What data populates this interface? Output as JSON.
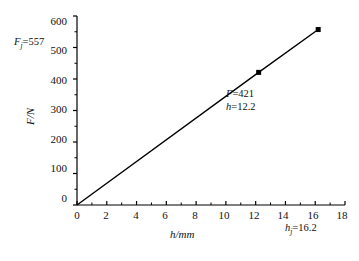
{
  "chart_data": {
    "type": "line",
    "title": "",
    "xlabel": "h/mm",
    "ylabel": "F/N",
    "xlim": [
      0,
      18
    ],
    "ylim": [
      0,
      600
    ],
    "grid": false,
    "legend": null,
    "x_ticks": [
      "0",
      "2",
      "4",
      "6",
      "8",
      "10",
      "12",
      "14",
      "16",
      "18"
    ],
    "x_tick_values": [
      0,
      2,
      4,
      6,
      8,
      10,
      12,
      14,
      16,
      18
    ],
    "y_ticks": [
      "0",
      "100",
      "200",
      "300",
      "400",
      "500",
      "600"
    ],
    "y_tick_values": [
      0,
      100,
      200,
      300,
      400,
      500,
      600
    ],
    "x_minor_step": 1,
    "y_minor_step": 50,
    "series": [
      {
        "name": "F vs h",
        "x": [
          0,
          12.2,
          16.2
        ],
        "values": [
          0,
          421,
          557
        ],
        "marker": "square",
        "marker_points": [
          {
            "x": 12.2,
            "y": 421
          },
          {
            "x": 16.2,
            "y": 557
          }
        ],
        "line_color": "#000000"
      }
    ],
    "annotations": [
      {
        "name": "fj-label",
        "text_prefix": "F",
        "text_sub": "j",
        "text_suffix": "=557",
        "value": 557,
        "axis": "y"
      },
      {
        "name": "hj-label",
        "text_prefix": "h",
        "text_sub": "j",
        "text_suffix": "=16.2",
        "value": 16.2,
        "axis": "x"
      },
      {
        "name": "point-force-label",
        "text_prefix": "F",
        "text_sub": "",
        "text_suffix": "=421",
        "value": 421,
        "axis": "point"
      },
      {
        "name": "point-height-label",
        "text_prefix": "h",
        "text_sub": "",
        "text_suffix": "=12.2",
        "value": 12.2,
        "axis": "point"
      }
    ]
  },
  "axes": {
    "y_title": "F/N",
    "x_title": "h/mm",
    "y_tick_0": "0",
    "y_tick_1": "100",
    "y_tick_2": "200",
    "y_tick_3": "300",
    "y_tick_4": "400",
    "y_tick_5": "500",
    "y_tick_6": "600",
    "x_tick_0": "0",
    "x_tick_1": "2",
    "x_tick_2": "4",
    "x_tick_3": "6",
    "x_tick_4": "8",
    "x_tick_5": "10",
    "x_tick_6": "12",
    "x_tick_7": "14",
    "x_tick_8": "16",
    "x_tick_9": "18"
  },
  "labels": {
    "fj_var": "F",
    "fj_sub": "j",
    "fj_eq": "=557",
    "hj_var": "h",
    "hj_sub": "j",
    "hj_eq": "=16.2",
    "pt_f_var": "F",
    "pt_f_eq": "=421",
    "pt_h_var": "h",
    "pt_h_eq": "=12.2"
  },
  "colors": {
    "line": "#000000",
    "axis": "#000000",
    "text": "#111111",
    "background": "#ffffff"
  }
}
